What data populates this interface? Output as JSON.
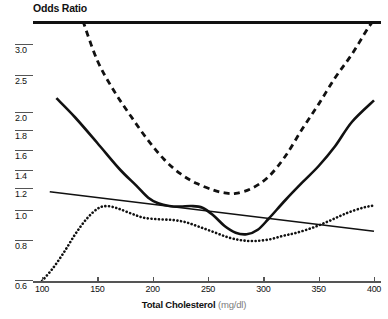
{
  "chart_data": {
    "type": "line",
    "title": "Odds Ratio",
    "xlabel_main": "Total Cholesterol",
    "xlabel_unit": "(mg/dl)",
    "ylabel": "Odds Ratio",
    "xlim": [
      100,
      400
    ],
    "ylim": [
      0.6,
      3.3
    ],
    "grid": false,
    "legend": "none",
    "xticks": [
      100,
      150,
      200,
      250,
      300,
      350,
      400
    ],
    "xtick_labels": [
      "100",
      "150",
      "200",
      "250",
      "300",
      "350",
      "400"
    ],
    "yticks": [
      3.0,
      2.5,
      2.0,
      1.8,
      1.6,
      1.4,
      1.2,
      1.0,
      0.8,
      0.6
    ],
    "ytick_labels": [
      "3.0",
      "2.5",
      "2.0",
      "1.8",
      "1.6",
      "1.4",
      "1.2",
      "1.0",
      "0.8",
      "0.6"
    ],
    "y_axis_scale": "non-linear (compressed above 2.0)",
    "series": [
      {
        "name": "solid-curve",
        "style": "solid",
        "width": 2.6,
        "color": "#111111",
        "x": [
          113,
          130,
          150,
          170,
          185,
          196,
          205,
          215,
          225,
          235,
          245,
          255,
          265,
          275,
          285,
          295,
          305,
          320,
          335,
          350,
          365,
          380,
          400
        ],
        "y": [
          2.2,
          1.95,
          1.68,
          1.42,
          1.24,
          1.12,
          1.07,
          1.045,
          1.04,
          1.045,
          1.03,
          0.97,
          0.9,
          0.855,
          0.845,
          0.875,
          0.95,
          1.1,
          1.27,
          1.45,
          1.65,
          1.9,
          2.17
        ]
      },
      {
        "name": "dashed-curve",
        "style": "dashed",
        "width": 2.8,
        "color": "#111111",
        "x": [
          137,
          150,
          165,
          180,
          195,
          210,
          225,
          240,
          255,
          265,
          275,
          290,
          305,
          320,
          335,
          350,
          365,
          380,
          395,
          400
        ],
        "y": [
          3.3,
          2.75,
          2.3,
          1.97,
          1.72,
          1.52,
          1.37,
          1.26,
          1.19,
          1.165,
          1.16,
          1.21,
          1.34,
          1.55,
          1.82,
          2.12,
          2.48,
          2.85,
          3.22,
          3.3
        ]
      },
      {
        "name": "dotted-curve",
        "style": "dotted",
        "width": 2.6,
        "color": "#111111",
        "x": [
          100,
          110,
          120,
          130,
          140,
          150,
          158,
          168,
          180,
          192,
          205,
          218,
          230,
          242,
          255,
          268,
          280,
          292,
          305,
          318,
          330,
          345,
          360,
          375,
          390,
          400
        ],
        "y": [
          0.6,
          0.665,
          0.745,
          0.845,
          0.945,
          1.02,
          1.045,
          1.025,
          0.985,
          0.955,
          0.945,
          0.94,
          0.925,
          0.895,
          0.86,
          0.825,
          0.805,
          0.8,
          0.81,
          0.835,
          0.855,
          0.89,
          0.935,
          0.985,
          1.03,
          1.05
        ]
      },
      {
        "name": "trend-line",
        "style": "solid-thin",
        "width": 1.6,
        "color": "#111111",
        "x": [
          107,
          400
        ],
        "y": [
          1.175,
          0.865
        ]
      }
    ]
  }
}
